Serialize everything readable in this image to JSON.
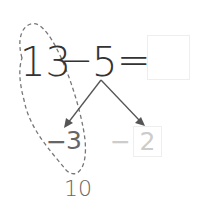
{
  "equation": {
    "minuend": "13",
    "operator": "−",
    "subtrahend": "5",
    "equals": "=",
    "answer_box": ""
  },
  "decomposition": {
    "left": {
      "operator": "−",
      "value": "3"
    },
    "right": {
      "operator": "−",
      "value": "2"
    }
  },
  "grouped_result": "10",
  "colors": {
    "main_text": "#333333",
    "split_text": "#666666",
    "faded_text": "#cccccc",
    "box_border": "#eeeeee",
    "dashed_loop": "#777777"
  }
}
